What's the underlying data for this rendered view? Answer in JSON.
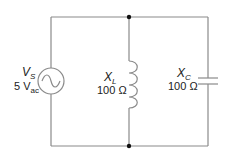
{
  "diagram": {
    "type": "parallel LC circuit",
    "source": {
      "symbol": "V",
      "subscript": "S",
      "value": "5 V",
      "value_subscript": "ac",
      "icon": "ac-source-icon"
    },
    "inductor": {
      "symbol": "X",
      "subscript": "L",
      "value": "100 Ω",
      "icon": "inductor-icon"
    },
    "capacitor": {
      "symbol": "X",
      "subscript": "C",
      "value": "100 Ω",
      "icon": "capacitor-icon"
    },
    "colors": {
      "wire": "#8a8a8a",
      "text": "#222222",
      "node": "#111111"
    }
  }
}
